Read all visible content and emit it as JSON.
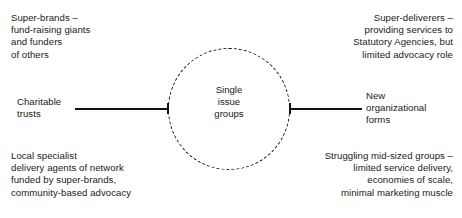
{
  "diagram": {
    "center": {
      "label": "Single\nissue\ngroups",
      "shape": "dashed-circle"
    },
    "axis_labels": {
      "left": "Charitable\ntrusts",
      "right": "New\norganizational\nforms"
    },
    "quadrants": {
      "top_left": "Super-brands –\nfund-raising giants\nand funders\nof others",
      "top_right": "Super-deliverers –\nproviding services to\nStatutory Agencies, but\nlimited advocacy role",
      "bottom_left": "Local specialist\ndelivery agents of network\nfunded by super-brands,\ncommunity-based advocacy",
      "bottom_right": "Struggling mid-sized groups –\nlimited service delivery,\neconomies of scale,\nminimal marketing muscle"
    },
    "colors": {
      "stroke": "#111111",
      "text": "#1a1a1a",
      "background": "#ffffff"
    }
  }
}
